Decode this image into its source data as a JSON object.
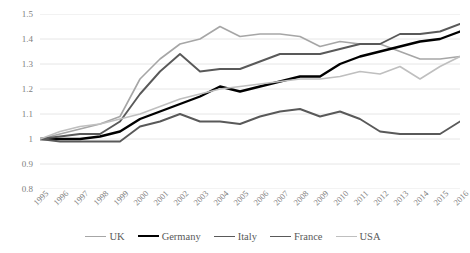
{
  "chart_data": {
    "type": "line",
    "title": "",
    "subtitle": "",
    "xlabel": "",
    "ylabel": "",
    "grid": true,
    "legend_position": "bottom",
    "xlim": [
      1995,
      2016
    ],
    "ylim": [
      0.8,
      1.5
    ],
    "ytick_labels": [
      "1.5",
      "1.4",
      "1.3",
      "1.2",
      "1.1",
      "1",
      "0.9",
      "0.8"
    ],
    "ytick_values": [
      1.5,
      1.4,
      1.3,
      1.2,
      1.1,
      1.0,
      0.9,
      0.8
    ],
    "categories": [
      "1995",
      "1996",
      "1997",
      "1998",
      "1999",
      "2000",
      "2001",
      "2002",
      "2003",
      "2004",
      "2005",
      "2006",
      "2007",
      "2008",
      "2009",
      "2010",
      "2011",
      "2012",
      "2013",
      "2014",
      "2015",
      "2016"
    ],
    "series": [
      {
        "name": "UK",
        "color": "#a6a6a6",
        "width": 1.6,
        "values": [
          1.0,
          1.02,
          1.04,
          1.06,
          1.09,
          1.24,
          1.32,
          1.38,
          1.4,
          1.45,
          1.41,
          1.42,
          1.42,
          1.41,
          1.37,
          1.39,
          1.38,
          1.38,
          1.35,
          1.32,
          1.32,
          1.33
        ]
      },
      {
        "name": "Germany",
        "color": "#000000",
        "width": 2.4,
        "values": [
          1.0,
          1.0,
          1.0,
          1.01,
          1.03,
          1.08,
          1.11,
          1.14,
          1.17,
          1.21,
          1.19,
          1.21,
          1.23,
          1.25,
          1.25,
          1.3,
          1.33,
          1.35,
          1.37,
          1.39,
          1.4,
          1.43
        ]
      },
      {
        "name": "Italy",
        "color": "#595959",
        "width": 1.9,
        "values": [
          1.0,
          0.99,
          0.99,
          0.99,
          0.99,
          1.05,
          1.07,
          1.1,
          1.07,
          1.07,
          1.06,
          1.09,
          1.11,
          1.12,
          1.09,
          1.11,
          1.08,
          1.03,
          1.02,
          1.02,
          1.02,
          1.07
        ]
      },
      {
        "name": "France",
        "color": "#595959",
        "width": 1.9,
        "values": [
          1.0,
          1.01,
          1.02,
          1.02,
          1.07,
          1.18,
          1.27,
          1.34,
          1.27,
          1.28,
          1.28,
          1.31,
          1.34,
          1.34,
          1.34,
          1.36,
          1.38,
          1.38,
          1.42,
          1.42,
          1.43,
          1.46
        ]
      },
      {
        "name": "USA",
        "color": "#bfbfbf",
        "width": 1.6,
        "values": [
          1.0,
          1.03,
          1.05,
          1.06,
          1.08,
          1.1,
          1.13,
          1.16,
          1.18,
          1.2,
          1.21,
          1.22,
          1.23,
          1.24,
          1.24,
          1.25,
          1.27,
          1.26,
          1.29,
          1.24,
          1.29,
          1.33
        ]
      }
    ]
  },
  "legend": {
    "items": [
      {
        "label": "UK"
      },
      {
        "label": "Germany"
      },
      {
        "label": "Italy"
      },
      {
        "label": "France"
      },
      {
        "label": "USA"
      }
    ]
  }
}
